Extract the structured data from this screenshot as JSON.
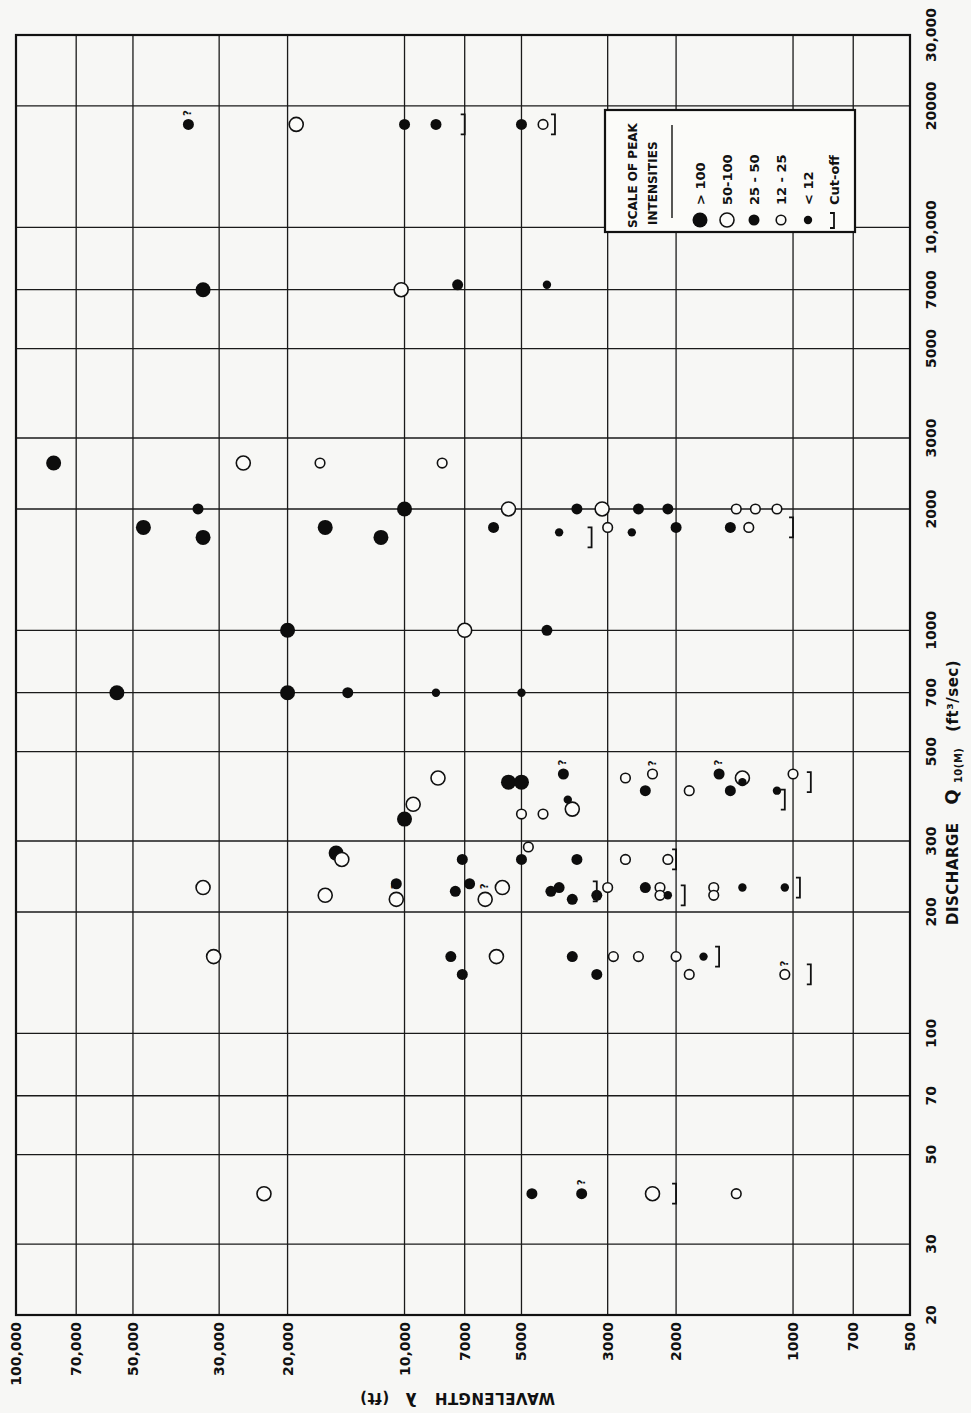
{
  "chart_data": {
    "type": "scatter",
    "orientation": "rotated 90deg clockwise (discharge axis runs along the right edge, bottom-to-top; wavelength axis along the bottom, decreasing left-to-right)",
    "title": "",
    "xlabel": "DISCHARGE Q10(M) (ft³/sec)",
    "ylabel": "WAVELENGTH λ (ft)",
    "x_scale": "log",
    "y_scale": "log",
    "xlim": [
      20,
      30000
    ],
    "ylim": [
      500,
      100000
    ],
    "grid": true,
    "x_ticks": [
      20,
      30,
      50,
      70,
      100,
      200,
      300,
      500,
      700,
      1000,
      2000,
      3000,
      5000,
      7000,
      10000,
      20000,
      30000
    ],
    "x_tick_labels": [
      "20",
      "30",
      "50",
      "70",
      "100",
      "200",
      "300",
      "500",
      "700",
      "1000",
      "2000",
      "3000",
      "5000",
      "7000",
      "10,000",
      "20000",
      "30,000"
    ],
    "y_ticks": [
      100000,
      70000,
      50000,
      30000,
      20000,
      10000,
      7000,
      5000,
      3000,
      2000,
      1000,
      700,
      500
    ],
    "y_tick_labels": [
      "100,000",
      "70,000",
      "50,000",
      "30,000",
      "20,000",
      "10,000",
      "7000",
      "5000",
      "3000",
      "2000",
      "1000",
      "700",
      "500"
    ],
    "legend": {
      "title_line1": "SCALE OF PEAK",
      "title_line2": "INTENSITIES",
      "position": "upper-right (rotated)",
      "entries": [
        {
          "symbol": "large-filled",
          "label": "> 100"
        },
        {
          "symbol": "large-open",
          "label": "50-100"
        },
        {
          "symbol": "medium-filled",
          "label": "25 - 50"
        },
        {
          "symbol": "small-open",
          "label": "12 - 25"
        },
        {
          "symbol": "small-filled",
          "label": "< 12"
        },
        {
          "symbol": "bracket",
          "label": "Cut-off"
        }
      ]
    },
    "series": [
      {
        "name": "> 100",
        "symbol": "large-filled",
        "points": [
          {
            "q": 2600,
            "lambda": 80000
          },
          {
            "q": 7000,
            "lambda": 33000
          },
          {
            "q": 1800,
            "lambda": 47000
          },
          {
            "q": 1700,
            "lambda": 33000
          },
          {
            "q": 1800,
            "lambda": 16000
          },
          {
            "q": 1700,
            "lambda": 11500
          },
          {
            "q": 2000,
            "lambda": 10000
          },
          {
            "q": 1000,
            "lambda": 20000
          },
          {
            "q": 700,
            "lambda": 20000
          },
          {
            "q": 700,
            "lambda": 55000
          },
          {
            "q": 420,
            "lambda": 5400
          },
          {
            "q": 420,
            "lambda": 5000
          },
          {
            "q": 340,
            "lambda": 10000
          },
          {
            "q": 280,
            "lambda": 15000
          }
        ]
      },
      {
        "name": "50-100",
        "symbol": "large-open",
        "points": [
          {
            "q": 18000,
            "lambda": 19000
          },
          {
            "q": 7000,
            "lambda": 10200
          },
          {
            "q": 2600,
            "lambda": 26000
          },
          {
            "q": 2000,
            "lambda": 5400
          },
          {
            "q": 2000,
            "lambda": 3100
          },
          {
            "q": 1000,
            "lambda": 7000
          },
          {
            "q": 430,
            "lambda": 8200
          },
          {
            "q": 370,
            "lambda": 9500
          },
          {
            "q": 360,
            "lambda": 3700
          },
          {
            "q": 430,
            "lambda": 1350
          },
          {
            "q": 270,
            "lambda": 14500
          },
          {
            "q": 230,
            "lambda": 33000
          },
          {
            "q": 220,
            "lambda": 16000
          },
          {
            "q": 230,
            "lambda": 5600
          },
          {
            "q": 215,
            "lambda": 10500,
            "uncertain": true
          },
          {
            "q": 215,
            "lambda": 6200,
            "uncertain": true
          },
          {
            "q": 155,
            "lambda": 31000
          },
          {
            "q": 155,
            "lambda": 5800
          },
          {
            "q": 40,
            "lambda": 23000
          },
          {
            "q": 40,
            "lambda": 2300
          }
        ]
      },
      {
        "name": "25 - 50",
        "symbol": "medium-filled",
        "points": [
          {
            "q": 18000,
            "lambda": 36000,
            "uncertain": true
          },
          {
            "q": 18000,
            "lambda": 10000
          },
          {
            "q": 18000,
            "lambda": 8300
          },
          {
            "q": 18000,
            "lambda": 5000
          },
          {
            "q": 7200,
            "lambda": 7300
          },
          {
            "q": 2000,
            "lambda": 34000
          },
          {
            "q": 2000,
            "lambda": 3600
          },
          {
            "q": 2000,
            "lambda": 2500
          },
          {
            "q": 2000,
            "lambda": 2100
          },
          {
            "q": 1800,
            "lambda": 5900
          },
          {
            "q": 1800,
            "lambda": 2000
          },
          {
            "q": 1800,
            "lambda": 1450
          },
          {
            "q": 1000,
            "lambda": 4300
          },
          {
            "q": 700,
            "lambda": 14000
          },
          {
            "q": 440,
            "lambda": 3900,
            "uncertain": true
          },
          {
            "q": 440,
            "lambda": 1550,
            "uncertain": true
          },
          {
            "q": 400,
            "lambda": 2400
          },
          {
            "q": 400,
            "lambda": 1450
          },
          {
            "q": 270,
            "lambda": 7100
          },
          {
            "q": 270,
            "lambda": 5000
          },
          {
            "q": 270,
            "lambda": 3600
          },
          {
            "q": 235,
            "lambda": 10500
          },
          {
            "q": 235,
            "lambda": 6800
          },
          {
            "q": 230,
            "lambda": 4000
          },
          {
            "q": 225,
            "lambda": 7400
          },
          {
            "q": 225,
            "lambda": 4200
          },
          {
            "q": 220,
            "lambda": 3200
          },
          {
            "q": 230,
            "lambda": 2400
          },
          {
            "q": 215,
            "lambda": 3700
          },
          {
            "q": 155,
            "lambda": 7600
          },
          {
            "q": 155,
            "lambda": 3700
          },
          {
            "q": 140,
            "lambda": 7100
          },
          {
            "q": 140,
            "lambda": 3200
          },
          {
            "q": 40,
            "lambda": 4700
          },
          {
            "q": 40,
            "lambda": 3500,
            "uncertain": true
          }
        ]
      },
      {
        "name": "12 - 25",
        "symbol": "small-open",
        "points": [
          {
            "q": 18000,
            "lambda": 4400
          },
          {
            "q": 2600,
            "lambda": 16500
          },
          {
            "q": 2600,
            "lambda": 8000
          },
          {
            "q": 2000,
            "lambda": 1400
          },
          {
            "q": 2000,
            "lambda": 1250
          },
          {
            "q": 2000,
            "lambda": 1100
          },
          {
            "q": 1800,
            "lambda": 3000
          },
          {
            "q": 1800,
            "lambda": 1300
          },
          {
            "q": 430,
            "lambda": 2700
          },
          {
            "q": 440,
            "lambda": 2300,
            "uncertain": true
          },
          {
            "q": 400,
            "lambda": 1850
          },
          {
            "q": 440,
            "lambda": 1000
          },
          {
            "q": 350,
            "lambda": 5000
          },
          {
            "q": 350,
            "lambda": 4400
          },
          {
            "q": 290,
            "lambda": 4800
          },
          {
            "q": 270,
            "lambda": 2700
          },
          {
            "q": 270,
            "lambda": 2100
          },
          {
            "q": 230,
            "lambda": 3000
          },
          {
            "q": 230,
            "lambda": 2200
          },
          {
            "q": 230,
            "lambda": 1600
          },
          {
            "q": 220,
            "lambda": 2200
          },
          {
            "q": 220,
            "lambda": 1600
          },
          {
            "q": 155,
            "lambda": 2900
          },
          {
            "q": 155,
            "lambda": 2500
          },
          {
            "q": 155,
            "lambda": 2000
          },
          {
            "q": 140,
            "lambda": 1850
          },
          {
            "q": 140,
            "lambda": 1050,
            "uncertain": true
          },
          {
            "q": 40,
            "lambda": 1400
          }
        ]
      },
      {
        "name": "< 12",
        "symbol": "small-filled",
        "points": [
          {
            "q": 7200,
            "lambda": 4300
          },
          {
            "q": 1750,
            "lambda": 4000
          },
          {
            "q": 1750,
            "lambda": 2600
          },
          {
            "q": 700,
            "lambda": 8300
          },
          {
            "q": 700,
            "lambda": 5000
          },
          {
            "q": 420,
            "lambda": 1350
          },
          {
            "q": 400,
            "lambda": 1100
          },
          {
            "q": 380,
            "lambda": 3800
          },
          {
            "q": 220,
            "lambda": 2100
          },
          {
            "q": 230,
            "lambda": 1350
          },
          {
            "q": 230,
            "lambda": 1050
          },
          {
            "q": 155,
            "lambda": 1700
          }
        ]
      }
    ],
    "cutoffs": [
      {
        "q": 18000,
        "lambda": 7000
      },
      {
        "q": 18000,
        "lambda": 4100
      },
      {
        "q": 1800,
        "lambda": 1000
      },
      {
        "q": 1700,
        "lambda": 3300
      },
      {
        "q": 420,
        "lambda": 900
      },
      {
        "q": 380,
        "lambda": 1050
      },
      {
        "q": 270,
        "lambda": 2000
      },
      {
        "q": 225,
        "lambda": 3200
      },
      {
        "q": 220,
        "lambda": 1900
      },
      {
        "q": 230,
        "lambda": 960
      },
      {
        "q": 155,
        "lambda": 1550
      },
      {
        "q": 140,
        "lambda": 900
      },
      {
        "q": 40,
        "lambda": 2000
      }
    ],
    "annotations": [
      "? marks uncertain peaks"
    ]
  },
  "axes": {
    "discharge_title": "DISCHARGE",
    "discharge_symbol": "Q",
    "discharge_subscript": "10(M)",
    "discharge_units": "(ft³/sec)",
    "wavelength_title": "WAVELENGTH",
    "wavelength_symbol": "λ",
    "wavelength_units": "(ft)"
  },
  "colors": {
    "ink": "#111111",
    "paper": "#f7f7f5"
  }
}
